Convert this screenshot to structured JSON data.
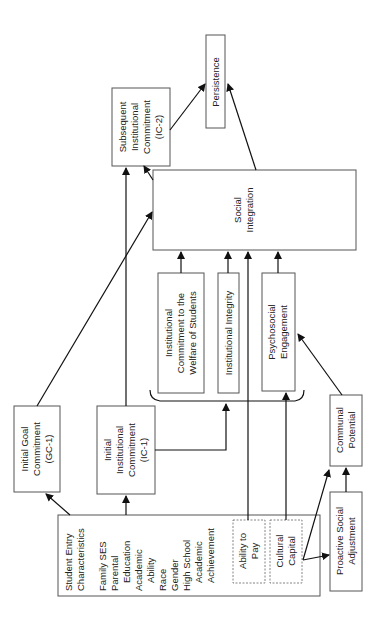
{
  "nodes": {
    "student_entry": {
      "title": [
        "Student Entry",
        "Characteristics"
      ],
      "items": [
        "Family SES",
        "Parental",
        "Education",
        "Academic",
        "Ability",
        "Race",
        "Gender",
        "High School",
        "Academic",
        "Achievement"
      ]
    },
    "ability_to_pay": [
      "Ability to",
      "Pay"
    ],
    "cultural_capital": [
      "Cultural",
      "Capital"
    ],
    "gc1": [
      "Initial Goal",
      "Commitment",
      "(GC-1)"
    ],
    "ic1": [
      "Initial",
      "Institutional",
      "Commitment",
      "(IC-1)"
    ],
    "ic2": [
      "Subsequent",
      "Institutional",
      "Commitment",
      "(IC-2)"
    ],
    "persistence": [
      "Persistence"
    ],
    "social_integration": [
      "Social",
      "Integration"
    ],
    "icws": [
      "Institutional",
      "Commitment to the",
      "Welfare of Students"
    ],
    "integrity": [
      "Institutional Integrity"
    ],
    "psychosocial": [
      "Psychosocial",
      "Engagement"
    ],
    "communal": [
      "Communal",
      "Potential"
    ],
    "proactive": [
      "Proactive Social",
      "Adjustment"
    ]
  }
}
